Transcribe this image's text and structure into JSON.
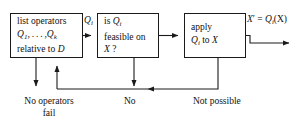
{
  "diagram": {
    "stroke_color": "#1a1a1a",
    "background_color": "#ffffff",
    "nodes": {
      "list_operators": {
        "line1": "list operators",
        "line2_q": "Q",
        "line2_sub1": "1",
        "line2_mid": ", . . . ,",
        "line2_q2": "Q",
        "line2_sub2": "k",
        "line3_pre": "relative to ",
        "line3_var": "D"
      },
      "feasible_check": {
        "line1_pre": "is ",
        "line1_q": "Q",
        "line1_sub": "i",
        "line2": "feasible on",
        "line3_var": "X",
        "line3_post": " ?"
      },
      "apply_operator": {
        "line1": "apply",
        "line2_q": "Q",
        "line2_sub": "i",
        "line2_mid": " to ",
        "line2_var": "X"
      }
    },
    "edge_labels": {
      "qi": {
        "q": "Q",
        "sub": "i"
      },
      "output": {
        "xprime": "X",
        "prime": "′",
        "eq": " = ",
        "q": "Q",
        "sub": "i",
        "arg": "(X)"
      }
    },
    "terminals": {
      "no_operators_fail": {
        "line1": "No operators",
        "line2": "fail"
      },
      "no": "No",
      "not_possible": "Not possible"
    }
  }
}
